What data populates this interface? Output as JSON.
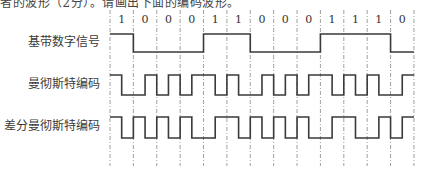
{
  "question_text_cropped": "者的波形（2分）。请画出下面的编码波形。",
  "bits": [
    1,
    0,
    0,
    0,
    1,
    1,
    0,
    0,
    0,
    1,
    1,
    1,
    0
  ],
  "rows": [
    {
      "label": "基带数字信号",
      "encoding": "nrz"
    },
    {
      "label": "曼彻斯特编码",
      "encoding": "manchester"
    },
    {
      "label": "差分曼彻斯特编码",
      "encoding": "differential-manchester"
    }
  ],
  "layout": {
    "x0": 110,
    "bit_width": 23.38,
    "bit_label_y": 23,
    "grid_top": 10,
    "grid_bottom": 166,
    "levels": [
      {
        "high": 34,
        "low": 52
      },
      {
        "high": 75,
        "low": 95
      },
      {
        "high": 117,
        "low": 138
      }
    ]
  },
  "colors": {
    "waveform": "#3a3a3a",
    "grid": "#888888"
  }
}
